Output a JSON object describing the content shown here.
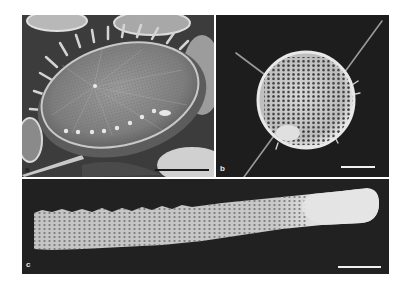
{
  "figure": {
    "panels": [
      {
        "id": "a",
        "label": "a",
        "subject": "diatom valve (SEM)",
        "scale_bar_color": "#1a1a1a"
      },
      {
        "id": "b",
        "label": "b",
        "subject": "spherical radiolarian with spines (SEM)",
        "scale_bar_color": "#f0f0f0"
      },
      {
        "id": "c",
        "label": "c",
        "subject": "elongated tubular latticed skeleton (SEM)",
        "scale_bar_color": "#f0f0f0"
      }
    ]
  }
}
